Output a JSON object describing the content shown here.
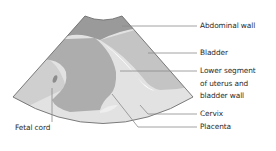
{
  "diagram": {
    "type": "ultrasound-schematic",
    "colors": {
      "background": "#ffffff",
      "abdominal_wall": "#9a9a9a",
      "bladder": "#c4c4c4",
      "placenta": "#adadad",
      "lower_field": "#e2e2e2",
      "left_field": "#cfcfcf",
      "bladder_wall": "#ffffff",
      "fetal_cord": "#8c8c8c",
      "outline": "#6e6e6e",
      "leader_line": "#8a8a8a",
      "label_text": "#2b2b2b"
    },
    "labels": [
      {
        "id": "abdominal-wall",
        "lines": [
          "Abdominal wall"
        ]
      },
      {
        "id": "bladder",
        "lines": [
          "Bladder"
        ]
      },
      {
        "id": "lower-segment",
        "lines": [
          "Lower segment",
          "of uterus and",
          "bladder wall"
        ]
      },
      {
        "id": "cervix",
        "lines": [
          "Cervix"
        ]
      },
      {
        "id": "placenta",
        "lines": [
          "Placenta"
        ]
      },
      {
        "id": "fetal-cord",
        "lines": [
          "Fetal cord"
        ]
      }
    ]
  }
}
